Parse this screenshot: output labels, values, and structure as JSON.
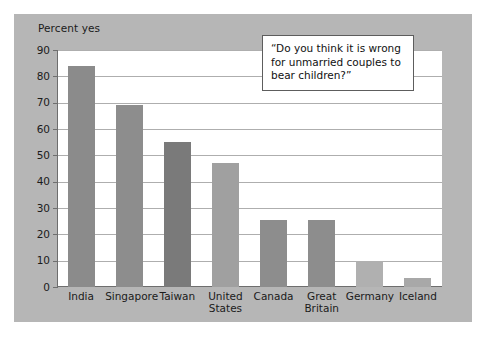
{
  "figure": {
    "axis_caption": "Percent yes",
    "callout_text": "“Do you think it is wrong for unmarried couples to bear children?”"
  },
  "colors": {
    "page_background": "#ffffff",
    "panel_background": "#b6b6b6",
    "plot_background": "#ffffff",
    "gridline": "#aeaeae",
    "axis": "#6e6e6e",
    "text": "#1b1b1b",
    "bar_dark": "#7a7a7a",
    "bar_medium": "#8d8d8d",
    "bar_light": "#a3a3a3",
    "callout_border": "#5d5d5d"
  },
  "chart_data": {
    "type": "bar",
    "title": "",
    "subtitle": "",
    "xlabel": "",
    "ylabel": "Percent yes",
    "ylim": [
      0,
      90
    ],
    "ytick_labels": [
      "0",
      "10",
      "20",
      "30",
      "40",
      "50",
      "60",
      "70",
      "80",
      "90"
    ],
    "yticks": [
      0,
      10,
      20,
      30,
      40,
      50,
      60,
      70,
      80,
      90
    ],
    "grid": "horizontal",
    "legend": "none",
    "categories": [
      "India",
      "Singapore",
      "Taiwan",
      "United States",
      "Canada",
      "Great Britain",
      "Germany",
      "Iceland"
    ],
    "category_label_lines": [
      [
        "India"
      ],
      [
        "Singapore"
      ],
      [
        "Taiwan"
      ],
      [
        "United",
        "States"
      ],
      [
        "Canada"
      ],
      [
        "Great",
        "Britain"
      ],
      [
        "Germany"
      ],
      [
        "Iceland"
      ]
    ],
    "values": [
      84,
      69,
      55,
      47,
      25.5,
      25.5,
      10,
      3.5
    ],
    "bar_colors": [
      "#8b8b8b",
      "#8d8d8d",
      "#7a7a7a",
      "#a0a0a0",
      "#8d8d8d",
      "#8d8d8d",
      "#b0b0b0",
      "#a8a8a8"
    ],
    "annotations": [
      {
        "name": "survey-question-callout",
        "text": "“Do you think it is wrong for unmarried couples to bear children?”"
      }
    ]
  }
}
